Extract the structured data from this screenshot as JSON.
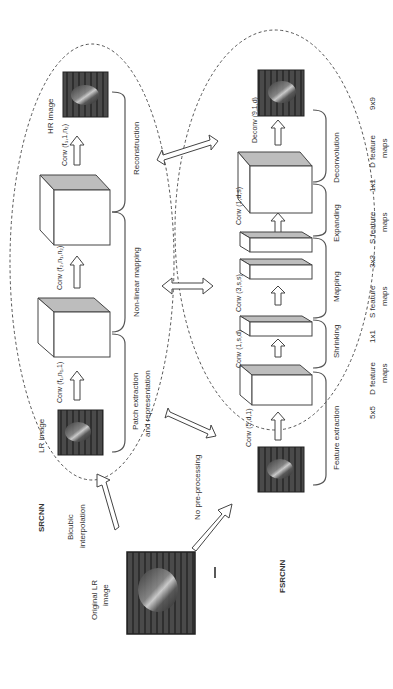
{
  "figure": {
    "orientation": "rotated 90 degrees counterclockwise",
    "srcnn": {
      "title": "SRCNN",
      "preprocess_label": [
        "Bicubic",
        "interpolation"
      ],
      "lr_image_label": "LR image",
      "hr_image_label": "HR image",
      "convs": [
        {
          "label": "Conv (f₁,n₁,1)"
        },
        {
          "label": "Conv (f₂,n₁,n₂)"
        },
        {
          "label": "Conv (f₃,1,n₂)"
        }
      ],
      "stages": [
        [
          "Patch extraction",
          "and representation"
        ],
        [
          "Non-linear mapping"
        ],
        [
          "Reconstruction"
        ]
      ]
    },
    "fsrcnn": {
      "title": "FSRCNN",
      "preprocess_label": "No pre-processing",
      "convs": [
        {
          "label": "Conv (5,d,1)"
        },
        {
          "label": "Conv (1,s,d)"
        },
        {
          "label": "Conv (3,s,s)"
        },
        {
          "label": "Conv (1,d,s)"
        },
        {
          "label": "Deconv (9,1,d)"
        }
      ],
      "stages": [
        "Feature extraction",
        "Shrinking",
        "Mapping",
        "Expanding",
        "Deconvolution"
      ],
      "feature_maps": [
        {
          "kernel": "5x5",
          "maps": [
            "D feature",
            "maps"
          ]
        },
        {
          "kernel": "1x1",
          "maps": [
            "S feature",
            "maps"
          ]
        },
        {
          "kernel": "3x3",
          "maps": [
            "S feature",
            "maps"
          ]
        },
        {
          "kernel": "1x1",
          "maps": [
            "D feature",
            "maps"
          ]
        },
        {
          "kernel": "9x9",
          "maps": []
        }
      ]
    },
    "original_lr_label": [
      "Original LR",
      "image"
    ]
  }
}
